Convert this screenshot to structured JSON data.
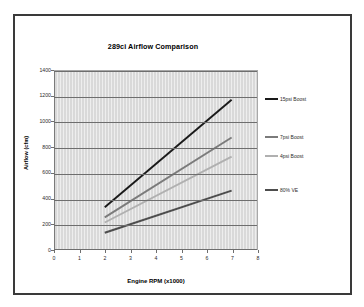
{
  "chart_data": {
    "type": "line",
    "title": "289ci Airflow Comparison",
    "xlabel": "Engine RPM (x1000)",
    "ylabel": "Airflow (cfm)",
    "xlim": [
      0,
      8
    ],
    "ylim": [
      0,
      1400
    ],
    "xticks": [
      "0",
      "1",
      "2",
      "3",
      "4",
      "5",
      "6",
      "7",
      "8"
    ],
    "yticks": [
      "0",
      "200",
      "400",
      "600",
      "800",
      "1000",
      "1200",
      "1400"
    ],
    "grid": "horizontal",
    "legend_position": "right",
    "x": [
      2,
      7
    ],
    "series": [
      {
        "name": "15psi Boost",
        "values": [
          335,
          1175
        ],
        "color": "#1a1a1a"
      },
      {
        "name": "7psi Boost",
        "values": [
          255,
          880
        ],
        "color": "#7b7b7b"
      },
      {
        "name": "4psi Boost",
        "values": [
          215,
          730
        ],
        "color": "#b0b0b0"
      },
      {
        "name": "80% VE",
        "values": [
          135,
          465
        ],
        "color": "#4d4d4d"
      }
    ]
  },
  "legend": {
    "items": [
      {
        "label": "15psi Boost"
      },
      {
        "label": "7psi Boost"
      },
      {
        "label": "4psi Boost"
      },
      {
        "label": "80% VE"
      }
    ]
  }
}
